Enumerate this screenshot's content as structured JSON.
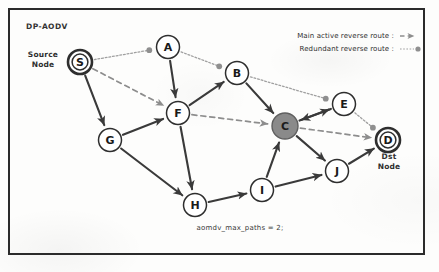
{
  "diagram": {
    "title": "DP-AODV",
    "caption": "aomdv_max_paths = 2;",
    "source_label": "Source\nNode",
    "source_label_line1": "Source",
    "source_label_line2": "Node",
    "dst_label_line1": "Dst",
    "dst_label_line2": "Node"
  },
  "legend": {
    "items": [
      {
        "label": "Main active reverse route :",
        "symbol": "dashed-arrow",
        "color": "#8d8d8d"
      },
      {
        "label": "Redundant reverse route :",
        "symbol": "dotted-line-dot",
        "color": "#9a9a9a"
      }
    ]
  },
  "colors": {
    "border": "#2b2b2b",
    "node_stroke": "#2e2e2e",
    "node_fill": "#ffffff",
    "highlight_node_fill": "#8a8a8a",
    "solid_edge": "#3a3a3a",
    "dashed_edge": "#8d8d8d",
    "dotted_edge": "#a0a0a0",
    "text": "#2f2f2f"
  },
  "nodes": [
    {
      "id": "S",
      "label": "S",
      "x": 80,
      "y": 62,
      "r": 12,
      "style": "double-ring",
      "fill": "#ffffff",
      "role": "source"
    },
    {
      "id": "A",
      "label": "A",
      "x": 168,
      "y": 47,
      "r": 11.5,
      "style": "plain",
      "fill": "#ffffff",
      "role": "relay"
    },
    {
      "id": "B",
      "label": "B",
      "x": 237,
      "y": 73,
      "r": 11.5,
      "style": "plain",
      "fill": "#ffffff",
      "role": "relay"
    },
    {
      "id": "F",
      "label": "F",
      "x": 178,
      "y": 113,
      "r": 11.5,
      "style": "plain",
      "fill": "#ffffff",
      "role": "relay"
    },
    {
      "id": "G",
      "label": "G",
      "x": 110,
      "y": 140,
      "r": 11.5,
      "style": "plain",
      "fill": "#ffffff",
      "role": "relay"
    },
    {
      "id": "C",
      "label": "C",
      "x": 285,
      "y": 126,
      "r": 13,
      "style": "filled",
      "fill": "#8a8a8a",
      "role": "highlighted"
    },
    {
      "id": "E",
      "label": "E",
      "x": 344,
      "y": 104,
      "r": 11.5,
      "style": "plain",
      "fill": "#ffffff",
      "role": "relay"
    },
    {
      "id": "D",
      "label": "D",
      "x": 388,
      "y": 140,
      "r": 12,
      "style": "double-ring",
      "fill": "#ffffff",
      "role": "destination"
    },
    {
      "id": "J",
      "label": "J",
      "x": 337,
      "y": 171,
      "r": 11.5,
      "style": "plain",
      "fill": "#ffffff",
      "role": "relay"
    },
    {
      "id": "I",
      "label": "I",
      "x": 262,
      "y": 190,
      "r": 11.5,
      "style": "plain",
      "fill": "#ffffff",
      "role": "relay"
    },
    {
      "id": "H",
      "label": "H",
      "x": 195,
      "y": 205,
      "r": 11.5,
      "style": "plain",
      "fill": "#ffffff",
      "role": "relay"
    }
  ],
  "edges": [
    {
      "from": "A",
      "to": "F",
      "kind": "solid",
      "arrow": true
    },
    {
      "from": "S",
      "to": "G",
      "kind": "solid",
      "arrow": true
    },
    {
      "from": "G",
      "to": "F",
      "kind": "solid",
      "arrow": true
    },
    {
      "from": "G",
      "to": "H",
      "kind": "solid",
      "arrow": true
    },
    {
      "from": "F",
      "to": "H",
      "kind": "solid",
      "arrow": true
    },
    {
      "from": "F",
      "to": "B",
      "kind": "solid",
      "arrow": true
    },
    {
      "from": "B",
      "to": "C",
      "kind": "solid",
      "arrow": true
    },
    {
      "from": "H",
      "to": "I",
      "kind": "solid",
      "arrow": true
    },
    {
      "from": "I",
      "to": "J",
      "kind": "solid",
      "arrow": true
    },
    {
      "from": "I",
      "to": "C",
      "kind": "solid",
      "arrow": true
    },
    {
      "from": "C",
      "to": "E",
      "kind": "solid",
      "arrow": true
    },
    {
      "from": "C",
      "to": "J",
      "kind": "solid",
      "arrow": true
    },
    {
      "from": "E",
      "to": "C",
      "kind": "solid",
      "arrow": true
    },
    {
      "from": "J",
      "to": "D",
      "kind": "solid",
      "arrow": true
    },
    {
      "from": "S",
      "to": "F",
      "kind": "dashed",
      "arrow": true
    },
    {
      "from": "F",
      "to": "C",
      "kind": "dashed",
      "arrow": true
    },
    {
      "from": "C",
      "to": "D",
      "kind": "dashed",
      "arrow": true
    },
    {
      "from": "S",
      "to": "A",
      "kind": "dotted",
      "arrow": false,
      "end_dot": true
    },
    {
      "from": "A",
      "to": "B",
      "kind": "dotted",
      "arrow": false,
      "end_dot": true
    },
    {
      "from": "B",
      "to": "E",
      "kind": "dotted",
      "arrow": false,
      "end_dot": true
    },
    {
      "from": "E",
      "to": "D",
      "kind": "dotted",
      "arrow": false,
      "end_dot": true
    }
  ]
}
